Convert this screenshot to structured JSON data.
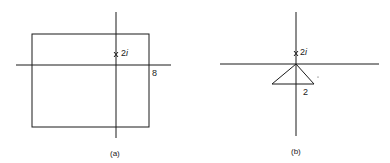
{
  "panels": [
    {
      "id": "a",
      "caption": "(a)",
      "pole_label": "2",
      "pole_label_imag": "i",
      "pole_marker": "x",
      "width_label": "8",
      "shape": "rectangle"
    },
    {
      "id": "b",
      "caption": "(b)",
      "pole_label": "2",
      "pole_label_imag": "i",
      "pole_marker": "x",
      "width_label": "2",
      "shape": "triangle"
    }
  ],
  "colors": {
    "line": "#1a1a1a",
    "background": "#ffffff"
  }
}
